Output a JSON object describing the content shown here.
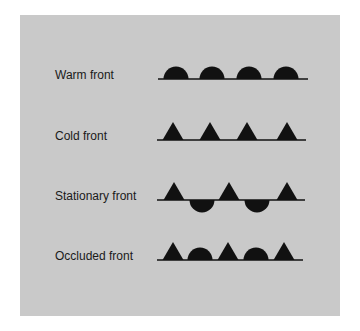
{
  "colors": {
    "background": "#ffffff",
    "panel": "#c9c9c9",
    "symbol": "#111111",
    "text": "#1a1a1a"
  },
  "fronts": [
    {
      "label": "Warm front",
      "symbol": "semicircles",
      "line": {
        "x1": 158,
        "x2": 308,
        "y": 79
      },
      "shapes": [
        {
          "type": "semicircle-up",
          "cx": 176
        },
        {
          "type": "semicircle-up",
          "cx": 212
        },
        {
          "type": "semicircle-up",
          "cx": 249
        },
        {
          "type": "semicircle-up",
          "cx": 286
        }
      ]
    },
    {
      "label": "Cold front",
      "symbol": "triangles",
      "line": {
        "x1": 157,
        "x2": 306,
        "y": 140
      },
      "shapes": [
        {
          "type": "triangle-up",
          "cx": 173
        },
        {
          "type": "triangle-up",
          "cx": 210
        },
        {
          "type": "triangle-up",
          "cx": 247
        },
        {
          "type": "triangle-up",
          "cx": 287
        }
      ]
    },
    {
      "label": "Stationary front",
      "symbol": "alternating triangles above and semicircles below",
      "line": {
        "x1": 157,
        "x2": 305,
        "y": 200
      },
      "shapes": [
        {
          "type": "triangle-up",
          "cx": 174
        },
        {
          "type": "semicircle-down",
          "cx": 202
        },
        {
          "type": "triangle-up",
          "cx": 229
        },
        {
          "type": "semicircle-down",
          "cx": 257
        },
        {
          "type": "triangle-up",
          "cx": 287
        }
      ]
    },
    {
      "label": "Occluded front",
      "symbol": "alternating triangles and semicircles on same side",
      "line": {
        "x1": 157,
        "x2": 303,
        "y": 260
      },
      "shapes": [
        {
          "type": "triangle-up",
          "cx": 173
        },
        {
          "type": "semicircle-up",
          "cx": 200
        },
        {
          "type": "triangle-up",
          "cx": 228
        },
        {
          "type": "semicircle-up",
          "cx": 256
        },
        {
          "type": "triangle-up",
          "cx": 284
        }
      ]
    }
  ]
}
